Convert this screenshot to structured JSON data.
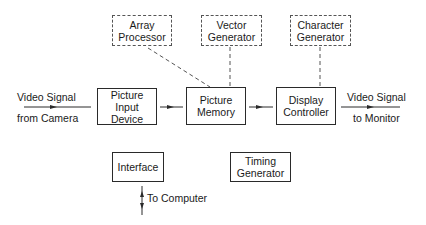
{
  "diagram": {
    "nodes": {
      "array_processor": {
        "line1": "Array",
        "line2": "Processor",
        "style": "dashed"
      },
      "vector_generator": {
        "line1": "Vector",
        "line2": "Generator",
        "style": "dashed"
      },
      "character_generator": {
        "line1": "Character",
        "line2": "Generator",
        "style": "dashed"
      },
      "picture_input_device": {
        "line1": "Picture",
        "line2": "Input",
        "line3": "Device",
        "style": "solid"
      },
      "picture_memory": {
        "line1": "Picture",
        "line2": "Memory",
        "style": "solid"
      },
      "display_controller": {
        "line1": "Display",
        "line2": "Controller",
        "style": "solid"
      },
      "interface": {
        "line1": "Interface",
        "style": "solid"
      },
      "timing_generator": {
        "line1": "Timing",
        "line2": "Generator",
        "style": "solid"
      }
    },
    "labels": {
      "input_top": "Video Signal",
      "input_bottom": "from Camera",
      "output_top": "Video Signal",
      "output_bottom": "to Monitor",
      "computer": "To Computer"
    },
    "edges": [
      {
        "from": "video_in",
        "to": "picture_input_device",
        "type": "arrow"
      },
      {
        "from": "picture_input_device",
        "to": "picture_memory",
        "type": "arrow"
      },
      {
        "from": "picture_memory",
        "to": "display_controller",
        "type": "arrow"
      },
      {
        "from": "display_controller",
        "to": "video_out",
        "type": "arrow"
      },
      {
        "from": "array_processor",
        "to": "picture_memory",
        "type": "dashed"
      },
      {
        "from": "vector_generator",
        "to": "picture_memory",
        "type": "dashed"
      },
      {
        "from": "character_generator",
        "to": "display_controller",
        "type": "dashed"
      },
      {
        "from": "interface",
        "to": "computer",
        "type": "bidirectional-arrow"
      }
    ],
    "colors": {
      "line": "#2a2a2a",
      "dashed": "#555555",
      "background": "#ffffff"
    }
  }
}
